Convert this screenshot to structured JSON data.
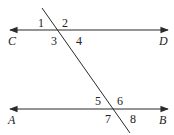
{
  "diagram": {
    "type": "parallel-lines-with-transversal",
    "colors": {
      "line": "#2a2a2a",
      "text": "#222222",
      "background": "#ffffff"
    },
    "lines": [
      {
        "name": "CD",
        "left_label": "C",
        "right_label": "D"
      },
      {
        "name": "AB",
        "left_label": "A",
        "right_label": "B"
      }
    ],
    "angles": {
      "top": [
        "1",
        "2",
        "3",
        "4"
      ],
      "bottom": [
        "5",
        "6",
        "7",
        "8"
      ]
    }
  }
}
